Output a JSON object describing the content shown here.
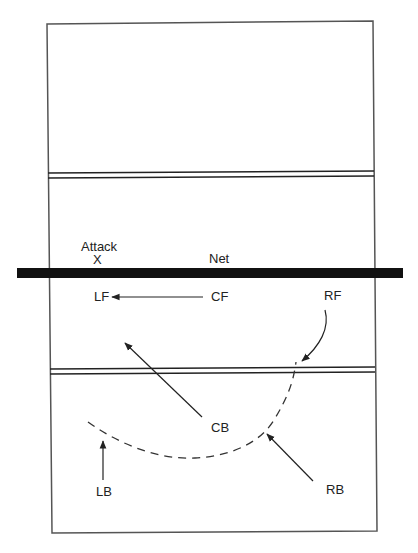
{
  "diagram": {
    "type": "volleyball-court-coverage",
    "labels": {
      "attack": "Attack",
      "attack_marker": "X",
      "net": "Net"
    },
    "players": [
      {
        "id": "LF",
        "label": "LF",
        "x": 94,
        "y": 301
      },
      {
        "id": "CF",
        "label": "CF",
        "x": 211,
        "y": 301
      },
      {
        "id": "RF",
        "label": "RF",
        "x": 325,
        "y": 300
      },
      {
        "id": "CB",
        "label": "CB",
        "x": 178,
        "y": 430
      },
      {
        "id": "LB",
        "label": "LB",
        "x": 97,
        "y": 495
      },
      {
        "id": "RB",
        "label": "RB",
        "x": 336,
        "y": 493
      }
    ],
    "movements": [
      {
        "from": "CF",
        "to": "LF",
        "style": "solid-arrow"
      },
      {
        "from": "CB",
        "to": "left-front-area",
        "style": "solid-arrow"
      },
      {
        "from": "LB",
        "to": "coverage-arc",
        "style": "solid-arrow"
      },
      {
        "from": "RB",
        "to": "coverage-arc",
        "style": "solid-arrow"
      },
      {
        "from": "RF",
        "to": "coverage-arc",
        "style": "curved-arrow"
      }
    ],
    "coverage_arc": {
      "style": "dashed"
    },
    "colors": {
      "line": "#333333",
      "net": "#111111",
      "background": "#ffffff"
    }
  }
}
